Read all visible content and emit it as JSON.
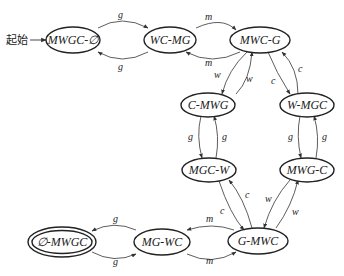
{
  "diagram": {
    "start_label": "起始",
    "nodes": [
      {
        "id": "n0",
        "label": "MWGC-∅"
      },
      {
        "id": "n1",
        "label": "WC-MG"
      },
      {
        "id": "n2",
        "label": "MWC-G"
      },
      {
        "id": "n3",
        "label": "C-MWG"
      },
      {
        "id": "n4",
        "label": "W-MGC"
      },
      {
        "id": "n5",
        "label": "MGC-W"
      },
      {
        "id": "n6",
        "label": "MWG-C"
      },
      {
        "id": "n7",
        "label": "G-MWC"
      },
      {
        "id": "n8",
        "label": "MG-WC"
      },
      {
        "id": "n9",
        "label": "∅-MWGC",
        "accepting": true
      }
    ],
    "edges": [
      {
        "from": "MWGC-∅",
        "to": "WC-MG",
        "label": "g"
      },
      {
        "from": "WC-MG",
        "to": "MWGC-∅",
        "label": "g"
      },
      {
        "from": "WC-MG",
        "to": "MWC-G",
        "label": "m"
      },
      {
        "from": "MWC-G",
        "to": "WC-MG",
        "label": "m"
      },
      {
        "from": "MWC-G",
        "to": "C-MWG",
        "label": "w"
      },
      {
        "from": "C-MWG",
        "to": "MWC-G",
        "label": "w"
      },
      {
        "from": "MWC-G",
        "to": "W-MGC",
        "label": "c"
      },
      {
        "from": "W-MGC",
        "to": "MWC-G",
        "label": "c"
      },
      {
        "from": "C-MWG",
        "to": "MGC-W",
        "label": "g"
      },
      {
        "from": "MGC-W",
        "to": "C-MWG",
        "label": "g"
      },
      {
        "from": "W-MGC",
        "to": "MWG-C",
        "label": "g"
      },
      {
        "from": "MWG-C",
        "to": "W-MGC",
        "label": "g"
      },
      {
        "from": "MGC-W",
        "to": "G-MWC",
        "label": "c"
      },
      {
        "from": "G-MWC",
        "to": "MGC-W",
        "label": "c"
      },
      {
        "from": "MWG-C",
        "to": "G-MWC",
        "label": "w"
      },
      {
        "from": "G-MWC",
        "to": "MWG-C",
        "label": "w"
      },
      {
        "from": "G-MWC",
        "to": "MG-WC",
        "label": "m"
      },
      {
        "from": "MG-WC",
        "to": "G-MWC",
        "label": "m"
      },
      {
        "from": "MG-WC",
        "to": "∅-MWGC",
        "label": "g"
      },
      {
        "from": "∅-MWGC",
        "to": "MG-WC",
        "label": "g"
      }
    ]
  }
}
